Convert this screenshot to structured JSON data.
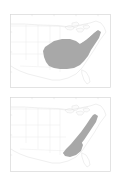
{
  "figure": {
    "title": "",
    "background_color": "#ffffff",
    "panel_count": 2
  },
  "colors": {
    "range_fill": "#a8a8a8",
    "coastline": "#e2e2e2",
    "state_border": "#e8e8e8",
    "frame": "#d8d8d8",
    "lake_fill": "#fbfbfb",
    "background": "#ffffff",
    "tick_label": "#e4e4e4"
  },
  "panels": [
    {
      "id": "panel-top",
      "label": "",
      "caption": "",
      "basemap": "north-america-eastern",
      "range_description": "Broad eastern United States distribution spanning the Midwest, Ohio Valley, Southeast and extending northeast along the Atlantic coast",
      "axis": {
        "x_ticks": [
          "",
          "",
          "",
          ""
        ],
        "y_ticks": [
          "",
          "",
          ""
        ],
        "grid": false
      }
    },
    {
      "id": "panel-bottom",
      "label": "",
      "caption": "",
      "basemap": "north-america-eastern",
      "range_description": "Narrow northeast-southwest band following the Appalachian Mountains and the southern Atlantic coastal plain",
      "axis": {
        "x_ticks": [
          "",
          "",
          "",
          ""
        ],
        "y_ticks": [
          "",
          "",
          ""
        ],
        "grid": false
      }
    }
  ]
}
